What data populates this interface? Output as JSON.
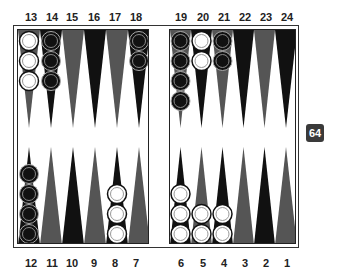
{
  "board": {
    "top_labels": [
      "13",
      "14",
      "15",
      "16",
      "17",
      "18",
      "19",
      "20",
      "21",
      "22",
      "23",
      "24"
    ],
    "bottom_labels": [
      "12",
      "11",
      "10",
      "9",
      "8",
      "7",
      "6",
      "5",
      "4",
      "3",
      "2",
      "1"
    ],
    "colors": {
      "black_point": "#111111",
      "gray_point": "#555555",
      "white_checker": "#ffffff",
      "black_checker": "#111111",
      "frame": "#222222"
    },
    "points": [
      {
        "point": 13,
        "color": "gray",
        "checkers": {
          "owner": "white",
          "count": 3
        }
      },
      {
        "point": 14,
        "color": "black",
        "checkers": {
          "owner": "black",
          "count": 3
        }
      },
      {
        "point": 15,
        "color": "gray",
        "checkers": {
          "owner": null,
          "count": 0
        }
      },
      {
        "point": 16,
        "color": "black",
        "checkers": {
          "owner": null,
          "count": 0
        }
      },
      {
        "point": 17,
        "color": "gray",
        "checkers": {
          "owner": null,
          "count": 0
        }
      },
      {
        "point": 18,
        "color": "black",
        "checkers": {
          "owner": "black",
          "count": 2
        }
      },
      {
        "point": 19,
        "color": "gray",
        "checkers": {
          "owner": "black",
          "count": 4
        }
      },
      {
        "point": 20,
        "color": "black",
        "checkers": {
          "owner": "white",
          "count": 2
        }
      },
      {
        "point": 21,
        "color": "gray",
        "checkers": {
          "owner": "black",
          "count": 2
        }
      },
      {
        "point": 22,
        "color": "black",
        "checkers": {
          "owner": null,
          "count": 0
        }
      },
      {
        "point": 23,
        "color": "gray",
        "checkers": {
          "owner": null,
          "count": 0
        }
      },
      {
        "point": 24,
        "color": "black",
        "checkers": {
          "owner": null,
          "count": 0
        }
      },
      {
        "point": 12,
        "color": "black",
        "checkers": {
          "owner": "black",
          "count": 4
        }
      },
      {
        "point": 11,
        "color": "gray",
        "checkers": {
          "owner": null,
          "count": 0
        }
      },
      {
        "point": 10,
        "color": "black",
        "checkers": {
          "owner": null,
          "count": 0
        }
      },
      {
        "point": 9,
        "color": "gray",
        "checkers": {
          "owner": null,
          "count": 0
        }
      },
      {
        "point": 8,
        "color": "black",
        "checkers": {
          "owner": "white",
          "count": 3
        }
      },
      {
        "point": 7,
        "color": "gray",
        "checkers": {
          "owner": null,
          "count": 0
        }
      },
      {
        "point": 6,
        "color": "black",
        "checkers": {
          "owner": "white",
          "count": 3
        }
      },
      {
        "point": 5,
        "color": "gray",
        "checkers": {
          "owner": "white",
          "count": 2
        }
      },
      {
        "point": 4,
        "color": "black",
        "checkers": {
          "owner": "white",
          "count": 2
        }
      },
      {
        "point": 3,
        "color": "gray",
        "checkers": {
          "owner": null,
          "count": 0
        }
      },
      {
        "point": 2,
        "color": "black",
        "checkers": {
          "owner": null,
          "count": 0
        }
      },
      {
        "point": 1,
        "color": "gray",
        "checkers": {
          "owner": null,
          "count": 0
        }
      }
    ]
  },
  "cube": {
    "value": "64"
  }
}
